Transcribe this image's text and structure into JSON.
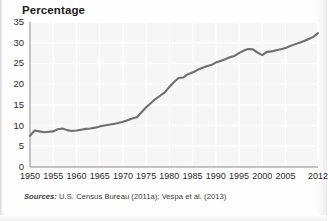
{
  "figure": {
    "title": "Percentage",
    "sources_label": "Sources:",
    "sources_text": " U.S. Census Bureau (2011a); Vespa et al. (2013)",
    "line_color": "#6f6f6f",
    "grid_color": "#f2f2f2",
    "plot_bg": "#f6f6f6",
    "axis_color": "#8c8c8c",
    "text_color": "#2a2a2a"
  },
  "chart_data": {
    "type": "line",
    "title": "Percentage",
    "xlabel": "",
    "ylabel": "Percentage",
    "xlim": [
      1950,
      2012
    ],
    "ylim": [
      0,
      35
    ],
    "grid": true,
    "legend": "none",
    "ytick_labels": [
      "0",
      "5",
      "10",
      "15",
      "20",
      "25",
      "30",
      "35"
    ],
    "yticks": [
      0,
      5,
      10,
      15,
      20,
      25,
      30,
      35
    ],
    "xtick_labels": [
      "1950",
      "1955",
      "1960",
      "1965",
      "1970",
      "1975",
      "1980",
      "1985",
      "1990",
      "1995",
      "2000",
      "2005",
      "2012"
    ],
    "xticks": [
      1950,
      1955,
      1960,
      1965,
      1970,
      1975,
      1980,
      1985,
      1990,
      1995,
      2000,
      2005,
      2012
    ],
    "series": [
      {
        "name": "Percentage",
        "x": [
          1950,
          1951,
          1952,
          1953,
          1954,
          1955,
          1956,
          1957,
          1958,
          1959,
          1960,
          1961,
          1962,
          1963,
          1964,
          1965,
          1966,
          1967,
          1968,
          1969,
          1970,
          1971,
          1972,
          1973,
          1974,
          1975,
          1976,
          1977,
          1978,
          1979,
          1980,
          1981,
          1982,
          1983,
          1984,
          1985,
          1986,
          1987,
          1988,
          1989,
          1990,
          1991,
          1992,
          1993,
          1994,
          1995,
          1996,
          1997,
          1998,
          1999,
          2000,
          2001,
          2002,
          2003,
          2004,
          2005,
          2006,
          2007,
          2008,
          2009,
          2010,
          2011,
          2012
        ],
        "values": [
          7.5,
          8.8,
          8.6,
          8.4,
          8.5,
          8.6,
          9.1,
          9.3,
          8.9,
          8.7,
          8.8,
          9.0,
          9.2,
          9.3,
          9.5,
          9.8,
          10.0,
          10.2,
          10.4,
          10.6,
          10.9,
          11.3,
          11.7,
          12.0,
          13.2,
          14.4,
          15.4,
          16.4,
          17.2,
          18.0,
          19.3,
          20.5,
          21.5,
          21.6,
          22.4,
          22.8,
          23.4,
          23.9,
          24.3,
          24.6,
          25.2,
          25.6,
          26.0,
          26.5,
          26.8,
          27.5,
          28.1,
          28.5,
          28.4,
          27.6,
          27.0,
          27.8,
          27.9,
          28.2,
          28.4,
          28.7,
          29.2,
          29.6,
          30.0,
          30.4,
          30.9,
          31.4,
          32.3
        ]
      }
    ]
  }
}
